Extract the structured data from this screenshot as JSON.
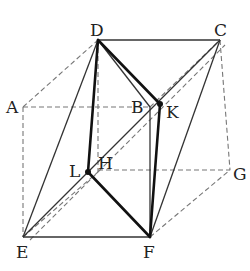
{
  "diagram": {
    "type": "cube-with-inscribed-tetrahedron",
    "colors": {
      "solid": "#333333",
      "thick": "#111111",
      "dashed": "#777777",
      "label": "#222222"
    },
    "points": {
      "A": {
        "label": "A",
        "x": 23,
        "y": 107
      },
      "B": {
        "label": "B",
        "x": 150,
        "y": 107
      },
      "C": {
        "label": "C",
        "x": 220,
        "y": 40
      },
      "D": {
        "label": "D",
        "x": 98,
        "y": 40
      },
      "E": {
        "label": "E",
        "x": 23,
        "y": 237
      },
      "F": {
        "label": "F",
        "x": 150,
        "y": 237
      },
      "G": {
        "label": "G",
        "x": 230,
        "y": 170
      },
      "H": {
        "label": "H",
        "x": 98,
        "y": 172
      },
      "K": {
        "label": "K",
        "x": 160,
        "y": 104
      },
      "L": {
        "label": "L",
        "x": 88,
        "y": 172
      }
    },
    "labels": {
      "A": "A",
      "B": "B",
      "C": "C",
      "D": "D",
      "E": "E",
      "F": "F",
      "G": "G",
      "H": "H",
      "K": "K",
      "L": "L"
    }
  }
}
